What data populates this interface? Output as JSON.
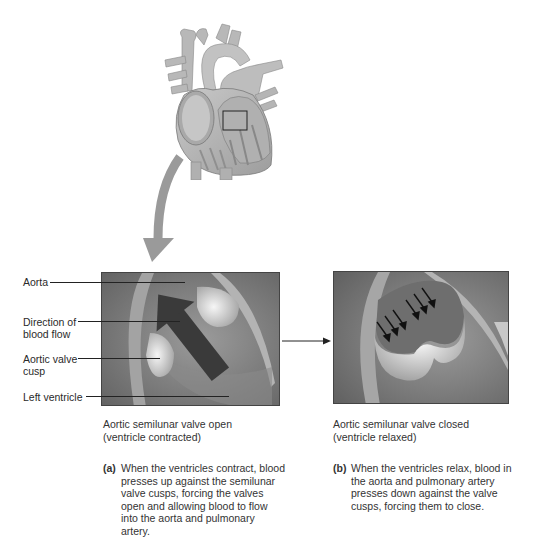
{
  "figure": {
    "overview": {
      "description": "Heart overview illustration with inset box on aortic valve region"
    },
    "panel_a": {
      "labels": [
        {
          "text": "Aorta"
        },
        {
          "text": "Direction of\nblood flow"
        },
        {
          "text": "Aortic valve\ncusp"
        },
        {
          "text": "Left ventricle"
        }
      ],
      "caption_line1": "Aortic semilunar valve open",
      "caption_line2": "(ventricle contracted)",
      "tag": "(a)",
      "description": "When the ventricles contract, blood\npresses up against the semilunar\nvalve cusps, forcing the valves\nopen and allowing blood to flow\ninto the aorta and pulmonary\nartery."
    },
    "panel_b": {
      "caption_line1": "Aortic semilunar valve closed",
      "caption_line2": "(ventricle relaxed)",
      "tag": "(b)",
      "description": "When the ventricles relax, blood in\nthe aorta and pulmonary artery\npresses down against the valve\ncusps, forcing them to close."
    },
    "colors": {
      "panel_bg": "#8a8a8a",
      "cusp": "#e8e8e8",
      "flow_arrow": "#3c3c3c",
      "heart": "#b5b5b5",
      "callout_arrow": "#9a9a9a"
    }
  }
}
